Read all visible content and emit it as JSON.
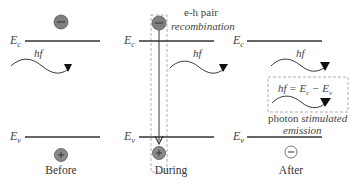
{
  "panels": [
    {
      "label": "Before",
      "ec": "E",
      "ec_sub": "c",
      "ev": "E",
      "ev_sub": "v",
      "photon": "hf",
      "top_carrier": "−",
      "bottom_carrier": "+"
    },
    {
      "label": "During",
      "ec": "E",
      "ec_sub": "c",
      "ev": "E",
      "ev_sub": "v",
      "photon": "hf",
      "top_carrier": "−",
      "bottom_carrier": "+",
      "annotation_line1": "e-h pair",
      "annotation_line2": "recombination"
    },
    {
      "label": "After",
      "ec": "E",
      "ec_sub": "c",
      "ev": "E",
      "ev_sub": "v",
      "photon": "hf",
      "bottom_carrier": "−",
      "equation": "hf = E",
      "equation_c": "c",
      "equation_mid": " − E",
      "equation_v": "v",
      "caption_plain": "photon ",
      "caption_italic1": "stimulated",
      "caption_italic2": "emission"
    }
  ],
  "colors": {
    "line": "#333333",
    "carrier_fill": "#8a8a8a",
    "dash": "#999999"
  }
}
